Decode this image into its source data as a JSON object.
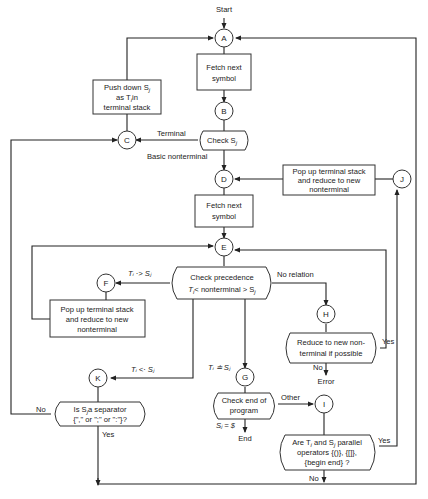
{
  "start_label": "Start",
  "end_label": "End",
  "error_label": "Error",
  "connectors": {
    "A": "A",
    "B": "B",
    "C": "C",
    "D": "D",
    "E": "E",
    "F": "F",
    "G": "G",
    "H": "H",
    "I": "I",
    "J": "J",
    "K": "K"
  },
  "boxes": {
    "fetch1": [
      "Fetch next",
      "symbol"
    ],
    "push": [
      "Push down S",
      "as T",
      "in",
      "terminal stack"
    ],
    "check_sj": "Check S",
    "pop_reduce_top": [
      "Pop up terminal stack",
      "and reduce to new",
      "nonterminal"
    ],
    "fetch2": [
      "Fetch next",
      "symbol"
    ],
    "check_prec": [
      "Check precedence",
      "T",
      "< nonterminal > S"
    ],
    "pop_reduce_left": [
      "Pop up terminal stack",
      "and reduce to new",
      "nonterminal"
    ],
    "reduce_possible": [
      "Reduce to new non-",
      "terminal if possible"
    ],
    "separator": [
      "Is S",
      "a separator",
      "{\",\" or \";\" or \":\"}?"
    ],
    "check_end": [
      "Check end of",
      "program"
    ],
    "parallel": [
      "Are T",
      "and S",
      "parallel",
      "operators {()}, {[]},",
      "{begin end} ?"
    ]
  },
  "edge_labels": {
    "terminal": "Terminal",
    "basic_nonterminal": "Basic nonterminal",
    "ti_gt_sj": "Tᵢ ·> Sⱼ",
    "no_relation": "No relation",
    "ti_lt_sj": "Tᵢ <· Sⱼ",
    "ti_eq_sj": "Tᵢ ≐ Sⱼ",
    "yes_reduce": "Yes",
    "no_reduce": "No",
    "no_sep": "No",
    "yes_sep": "Yes",
    "other": "Other",
    "sj_dollar": "Sⱼ = $",
    "yes_parallel": "Yes",
    "no_parallel": "No"
  }
}
